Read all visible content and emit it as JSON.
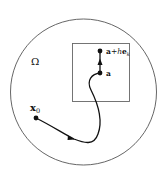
{
  "diagram": {
    "domain_label": "Ω",
    "start_point": {
      "label_main": "x",
      "label_sub": "0"
    },
    "point_a": {
      "label": "a"
    },
    "point_a_plus": {
      "label_a": "a",
      "label_plus": "+",
      "label_h": "h",
      "label_e": "e",
      "label_sub": "k"
    },
    "colors": {
      "stroke": "#111111",
      "boundary": "#555555",
      "background": "#ffffff"
    }
  }
}
